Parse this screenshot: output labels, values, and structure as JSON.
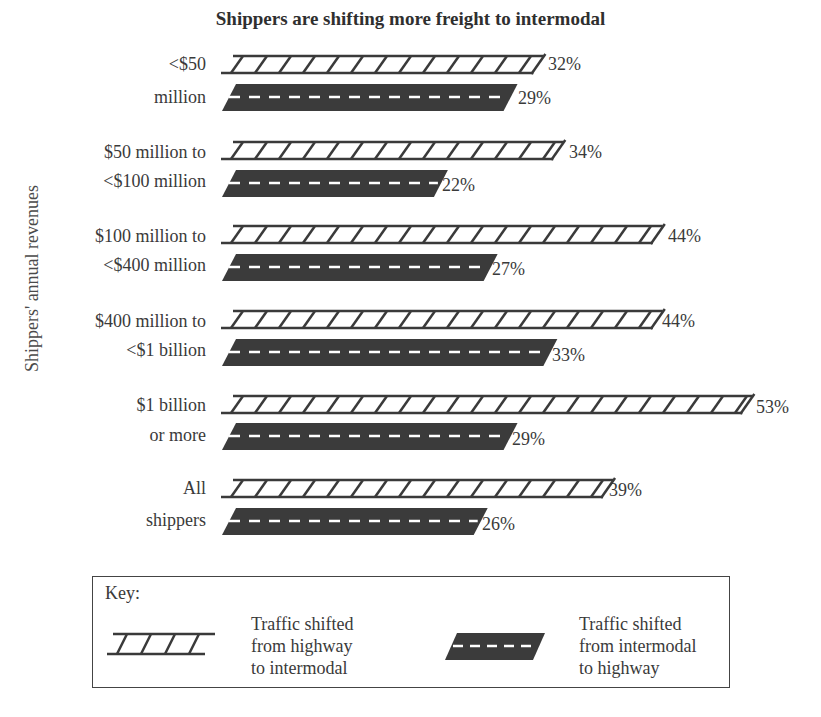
{
  "chart_data": {
    "type": "bar",
    "orientation": "horizontal",
    "title": "Shippers are shifting more freight to intermodal",
    "xlabel": "",
    "ylabel": "Shippers' annual revenues",
    "categories": [
      "<$50 million",
      "$50 million to <$100 million",
      "$100 million to <$400 million",
      "$400 million to <$1 billion",
      "$1 billion or more",
      "All shippers"
    ],
    "series": [
      {
        "name": "Traffic shifted from highway to intermodal",
        "values": [
          32,
          34,
          44,
          44,
          53,
          39
        ],
        "style": "rail-track"
      },
      {
        "name": "Traffic shifted from intermodal to highway",
        "values": [
          29,
          22,
          27,
          33,
          29,
          26
        ],
        "style": "road"
      }
    ],
    "unit": "%",
    "grid": false,
    "legend_position": "bottom"
  },
  "title": "Shippers are shifting more freight to intermodal",
  "ylabel": "Shippers' annual revenues",
  "groups": [
    {
      "line1": "<$50",
      "line2": "million",
      "rail": "32%",
      "road": "29%"
    },
    {
      "line1": "$50 million to",
      "line2": "<$100 million",
      "rail": "34%",
      "road": "22%"
    },
    {
      "line1": "$100 million to",
      "line2": "<$400 million",
      "rail": "44%",
      "road": "27%"
    },
    {
      "line1": "$400 million to",
      "line2": "<$1 billion",
      "rail": "44%",
      "road": "33%"
    },
    {
      "line1": "$1 billion",
      "line2": "or more",
      "rail": "53%",
      "road": "29%"
    },
    {
      "line1": "All",
      "line2": "shippers",
      "rail": "39%",
      "road": "26%"
    }
  ],
  "key": {
    "title": "Key:",
    "rail_l1": "Traffic shifted",
    "rail_l2": "from highway",
    "rail_l3": "to intermodal",
    "road_l1": "Traffic shifted",
    "road_l2": "from intermodal",
    "road_l3": "to highway"
  },
  "colors": {
    "rail": "#3a3a3a",
    "road": "#3b3b3b",
    "road_dash": "#ffffff"
  }
}
